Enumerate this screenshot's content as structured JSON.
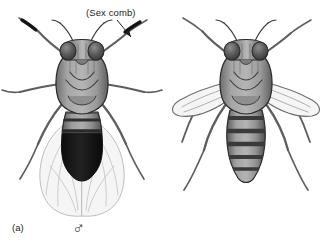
{
  "figure": {
    "kind": "scientific-illustration",
    "background_color": "#ffffff",
    "ink_color": "#1d1d1d"
  },
  "annotations": {
    "sex_comb_label": "(Sex comb)"
  },
  "panels": [
    {
      "id": "a",
      "label": "(a)",
      "sex_symbol": "♂",
      "sex_symbol_name": "male-symbol",
      "wing_posture": "folded-over-abdomen",
      "abdomen": "dark rounded tip, fused posterior bands",
      "has_sex_comb": true
    },
    {
      "id": "b",
      "label": "(b)",
      "sex_symbol": "♀",
      "sex_symbol_name": "female-symbol",
      "wing_posture": "spread-outward",
      "abdomen": "pointed tip, five distinct dark stripes",
      "has_sex_comb": false
    }
  ],
  "colors": {
    "outline": "#2b2b2b",
    "eye_dark": "#4a4a4a",
    "thorax_gray": "#9a9a9a",
    "abdomen_gray": "#8e8e8e",
    "abdomen_band": "#4d4d4d",
    "male_tip_dark": "#141414",
    "wing_fill": "#f4f4f4",
    "wing_vein": "#b5b5b5",
    "leg_gray": "#6f6f6f"
  }
}
